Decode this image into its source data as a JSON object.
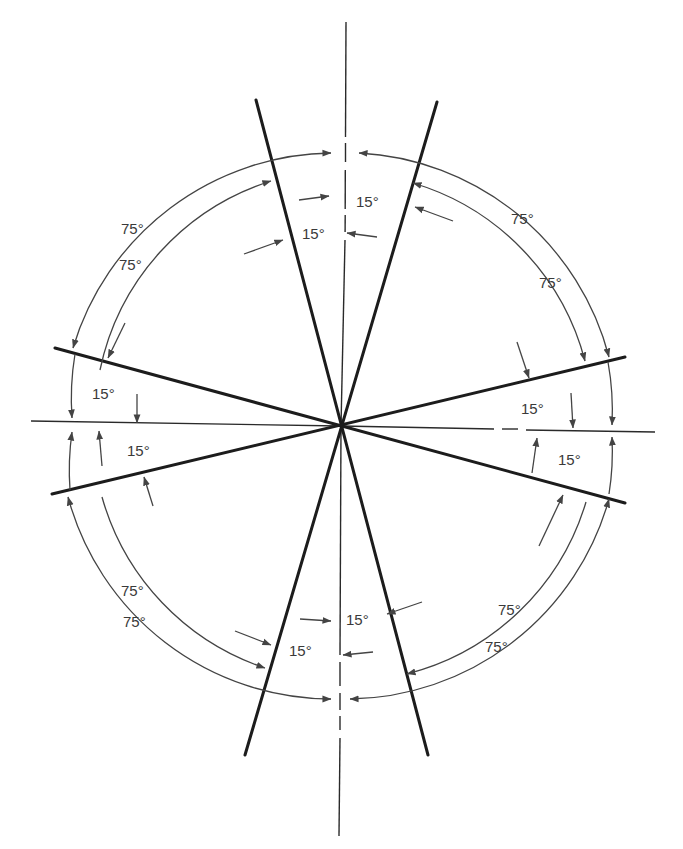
{
  "diagram": {
    "title": "",
    "center": {
      "x": 341,
      "y": 426
    },
    "colors": {
      "heavy_line": "#1c1c1c",
      "dim_line": "#444444",
      "text": "#3a3a3a",
      "background": "#ffffff"
    },
    "angle_between_lines_deg": 15,
    "outer_angle_deg": 75,
    "labels": {
      "top_15_a": "15°",
      "top_15_b": "15°",
      "bottom_15_a": "15°",
      "bottom_15_b": "15°",
      "left_15_a": "15°",
      "left_15_b": "15°",
      "right_15_a": "15°",
      "right_15_b": "15°",
      "tl_75_outer": "75°",
      "tl_75_inner": "75°",
      "tr_75_outer": "75°",
      "tr_75_inner": "75°",
      "bl_75_outer": "75°",
      "bl_75_inner": "75°",
      "br_75_outer": "75°",
      "br_75_inner": "75°"
    }
  }
}
